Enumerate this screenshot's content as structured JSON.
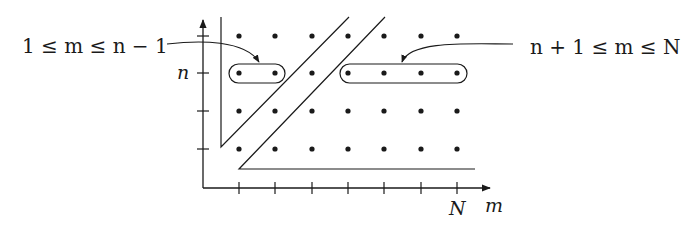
{
  "diagram": {
    "labels": {
      "left_region": "1 ≤ m ≤ n − 1",
      "right_region": "n + 1 ≤ m ≤ N",
      "y_tick_n": "n",
      "x_tick_N": "N",
      "x_axis": "m"
    },
    "grid": {
      "columns": 7,
      "rows": 4,
      "highlighted_row": "n"
    },
    "colors": {
      "ink": "#1a1a1a",
      "background": "#ffffff"
    }
  }
}
